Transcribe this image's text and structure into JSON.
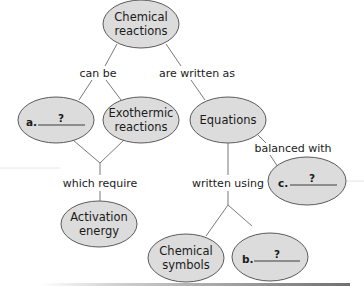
{
  "diagram": {
    "type": "concept-map",
    "colors": {
      "node_fill": "#dcdcdc",
      "node_stroke": "#5a5a5a",
      "text": "#1a1a1a",
      "connector": "#6a6a6a"
    },
    "nodes": {
      "chemical_reactions": {
        "line1": "Chemical",
        "line2": "reactions"
      },
      "blank_a": {
        "label": "a.",
        "placeholder": "?"
      },
      "exothermic_reactions": {
        "line1": "Exothermic",
        "line2": "reactions"
      },
      "equations": {
        "line1": "Equations"
      },
      "blank_c": {
        "label": "c.",
        "placeholder": "?"
      },
      "activation_energy": {
        "line1": "Activation",
        "line2": "energy"
      },
      "chemical_symbols": {
        "line1": "Chemical",
        "line2": "symbols"
      },
      "blank_b": {
        "label": "b.",
        "placeholder": "?"
      }
    },
    "links": {
      "can_be": "can be",
      "are_written_as": "are written as",
      "balanced_with": "balanced with",
      "which_require": "which require",
      "written_using": "written using"
    }
  }
}
